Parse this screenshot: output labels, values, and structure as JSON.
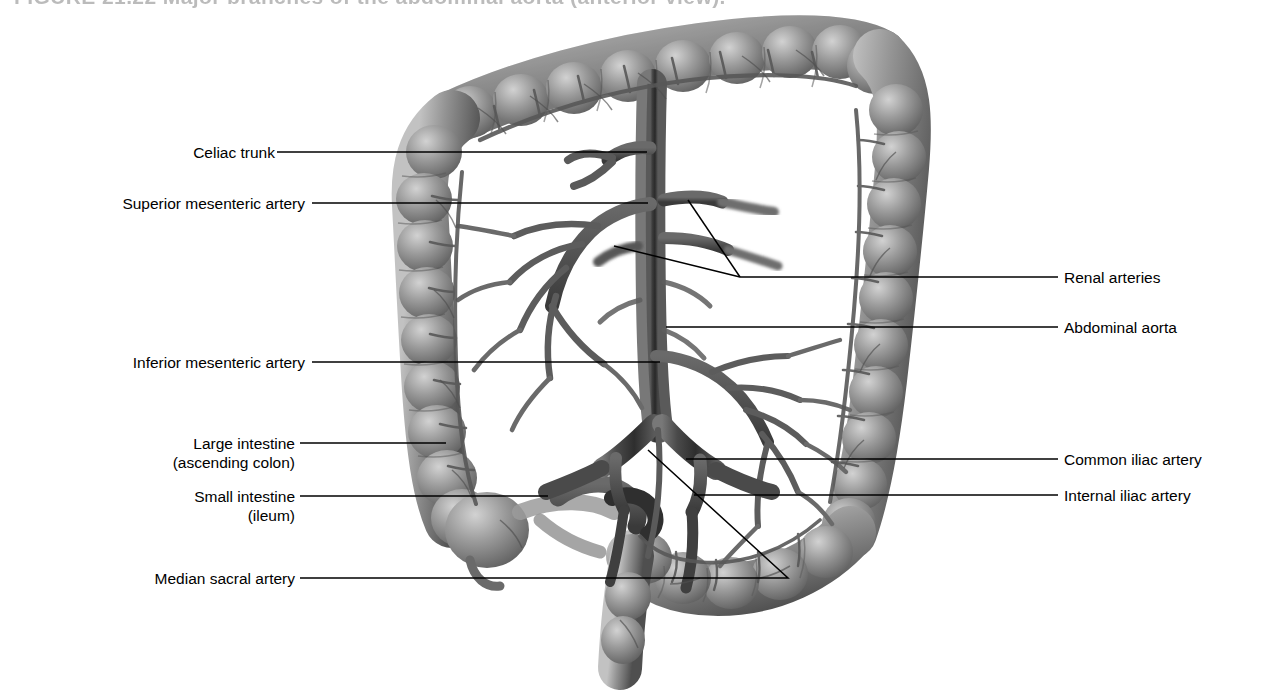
{
  "figure": {
    "title_remnant": "FIGURE 21.22  Major branches of the abdominal aorta (anterior view).",
    "view": "anterior view",
    "style": "grayscale medical illustration",
    "colors": {
      "background": "#ffffff",
      "leader_line": "#000000",
      "label_text": "#000000",
      "organ_mid": "#8a8a8a",
      "organ_dark": "#4e4e4e",
      "organ_light": "#c9c9c9",
      "vessel_dark": "#3c3c3c",
      "vessel_mid": "#6e6e6e"
    }
  },
  "labels_left": [
    {
      "id": "celiac-trunk",
      "name": "Celiac trunk",
      "sub": ""
    },
    {
      "id": "superior-mesenteric-artery",
      "name": "Superior mesenteric artery",
      "sub": ""
    },
    {
      "id": "inferior-mesenteric-artery",
      "name": "Inferior mesenteric artery",
      "sub": ""
    },
    {
      "id": "large-intestine",
      "name": "Large intestine",
      "sub": "(ascending colon)"
    },
    {
      "id": "small-intestine",
      "name": "Small intestine",
      "sub": "(ileum)"
    },
    {
      "id": "median-sacral-artery",
      "name": "Median sacral artery",
      "sub": ""
    }
  ],
  "labels_right": [
    {
      "id": "renal-arteries",
      "name": "Renal arteries"
    },
    {
      "id": "abdominal-aorta",
      "name": "Abdominal aorta"
    },
    {
      "id": "common-iliac-artery",
      "name": "Common iliac artery"
    },
    {
      "id": "internal-iliac-artery",
      "name": "Internal iliac artery"
    }
  ],
  "structures": [
    "transverse colon",
    "ascending colon",
    "descending colon",
    "sigmoid colon",
    "cecum",
    "ileum",
    "abdominal aorta",
    "celiac trunk",
    "superior mesenteric artery",
    "inferior mesenteric artery",
    "renal arteries",
    "common iliac artery",
    "internal iliac artery",
    "external iliac artery",
    "median sacral artery",
    "marginal artery arcades",
    "vasa recta"
  ]
}
